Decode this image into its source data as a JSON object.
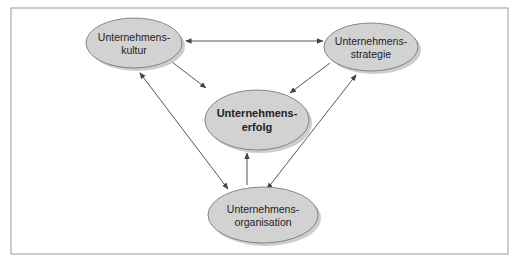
{
  "diagram": {
    "frame": {
      "x": 11,
      "y": 8,
      "width": 497,
      "height": 246,
      "border_color": "#9a9a9a"
    },
    "colors": {
      "node_fill": "#d2d2d2",
      "node_stroke": "#6e6e6e",
      "node_shadow": "#b8b8b8",
      "arrow": "#444444",
      "text": "#222222"
    },
    "nodes": [
      {
        "id": "kultur",
        "cx": 134,
        "cy": 43,
        "rx": 48,
        "ry": 25,
        "lines": [
          "Unternehmens-",
          "kultur"
        ],
        "bold": false
      },
      {
        "id": "strategie",
        "cx": 371,
        "cy": 47,
        "rx": 47,
        "ry": 24,
        "lines": [
          "Unternehmens-",
          "strategie"
        ],
        "bold": false
      },
      {
        "id": "erfolg",
        "cx": 257,
        "cy": 120,
        "rx": 52,
        "ry": 30,
        "lines": [
          "Unternehmens-",
          "erfolg"
        ],
        "bold": true
      },
      {
        "id": "organisation",
        "cx": 263,
        "cy": 215,
        "rx": 55,
        "ry": 28,
        "lines": [
          "Unternehmens-",
          "organisation"
        ],
        "bold": false
      }
    ],
    "edges": [
      {
        "from": "kultur",
        "to": "strategie",
        "bidirectional": true,
        "x1": 186,
        "y1": 41,
        "x2": 323,
        "y2": 41
      },
      {
        "from": "kultur",
        "to": "erfolg",
        "bidirectional": false,
        "x1": 172,
        "y1": 62,
        "x2": 206,
        "y2": 88
      },
      {
        "from": "strategie",
        "to": "erfolg",
        "bidirectional": false,
        "x1": 330,
        "y1": 63,
        "x2": 290,
        "y2": 93
      },
      {
        "from": "organisation",
        "to": "erfolg",
        "bidirectional": false,
        "x1": 247,
        "y1": 185,
        "x2": 247,
        "y2": 153
      },
      {
        "from": "kultur",
        "to": "organisation",
        "bidirectional": true,
        "x1": 140,
        "y1": 73,
        "x2": 228,
        "y2": 189
      },
      {
        "from": "strategie",
        "to": "organisation",
        "bidirectional": true,
        "x1": 356,
        "y1": 75,
        "x2": 267,
        "y2": 189
      }
    ]
  }
}
